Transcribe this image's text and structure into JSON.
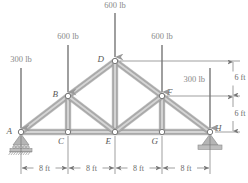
{
  "figure": {
    "colors": {
      "member": "#a9a9a9",
      "member_highlight": "#d8d8d8",
      "member_edge": "#8e8e8e",
      "load_arrow": "#9a9a9a",
      "dimension_line": "#777777",
      "node_fill": "#ffffff",
      "node_stroke": "#777777",
      "support_fill": "#b5b5b5",
      "text": "#6a6a6a",
      "background": "#ffffff"
    }
  },
  "nodes": [
    {
      "id": "A",
      "label": "A",
      "x": 21,
      "y": 132,
      "label_dx": -9,
      "label_dy": 2
    },
    {
      "id": "B",
      "label": "B",
      "x": 68,
      "y": 96,
      "label_dx": -10,
      "label_dy": 1
    },
    {
      "id": "C",
      "label": "C",
      "x": 68,
      "y": 132,
      "label_dx": -4,
      "label_dy": 12
    },
    {
      "id": "D",
      "label": "D",
      "x": 115,
      "y": 61,
      "label_dx": -11,
      "label_dy": 1
    },
    {
      "id": "E",
      "label": "E",
      "x": 115,
      "y": 132,
      "label_dx": -4,
      "label_dy": 12
    },
    {
      "id": "F",
      "label": "F",
      "x": 162,
      "y": 96,
      "label_dx": 5,
      "label_dy": -1
    },
    {
      "id": "G",
      "label": "G",
      "x": 162,
      "y": 132,
      "label_dx": -4,
      "label_dy": 12
    },
    {
      "id": "H",
      "label": "H",
      "x": 210,
      "y": 132,
      "label_dx": 5,
      "label_dy": -1
    }
  ],
  "members": [
    {
      "name": "A-C",
      "from": "A",
      "to": "C"
    },
    {
      "name": "C-E",
      "from": "C",
      "to": "E"
    },
    {
      "name": "E-G",
      "from": "E",
      "to": "G"
    },
    {
      "name": "G-H",
      "from": "G",
      "to": "H"
    },
    {
      "name": "A-B",
      "from": "A",
      "to": "B"
    },
    {
      "name": "B-D",
      "from": "B",
      "to": "D"
    },
    {
      "name": "D-F",
      "from": "D",
      "to": "F"
    },
    {
      "name": "F-H",
      "from": "F",
      "to": "H"
    },
    {
      "name": "B-C",
      "from": "B",
      "to": "C"
    },
    {
      "name": "D-E",
      "from": "D",
      "to": "E"
    },
    {
      "name": "F-G",
      "from": "F",
      "to": "G"
    },
    {
      "name": "B-E",
      "from": "B",
      "to": "E"
    },
    {
      "name": "E-F",
      "from": "E",
      "to": "F"
    }
  ],
  "loads": [
    {
      "name": "load-at-A",
      "label": "300 lb",
      "node": "A",
      "x": 21,
      "tip_y": 128,
      "top_y": 68,
      "label_x": 21,
      "label_y": 62,
      "anchor": "middle"
    },
    {
      "name": "load-at-B",
      "label": "600 lb",
      "node": "B",
      "x": 68,
      "tip_y": 92,
      "top_y": 45,
      "label_x": 68,
      "label_y": 39,
      "anchor": "middle"
    },
    {
      "name": "load-at-D",
      "label": "600 lb",
      "node": "D",
      "x": 115,
      "tip_y": 57,
      "top_y": 13,
      "label_x": 115,
      "label_y": 8,
      "anchor": "middle"
    },
    {
      "name": "load-at-F",
      "label": "600 lb",
      "node": "F",
      "x": 162,
      "tip_y": 92,
      "top_y": 45,
      "label_x": 162,
      "label_y": 39,
      "anchor": "middle"
    },
    {
      "name": "load-at-H",
      "label": "300 lb",
      "node": "H",
      "x": 210,
      "tip_y": 128,
      "top_y": 68,
      "label_x": 205,
      "label_y": 82,
      "anchor": "end"
    }
  ],
  "supports": [
    {
      "name": "support-left-roller",
      "node": "A",
      "type": "roller",
      "x": 21,
      "y": 132
    },
    {
      "name": "support-right-pin",
      "node": "H",
      "type": "pin",
      "x": 210,
      "y": 132
    }
  ],
  "dimensions": {
    "horizontal": {
      "baseline_y": 168,
      "spans": [
        {
          "label": "8 ft",
          "x1": 21,
          "x2": 68
        },
        {
          "label": "8 ft",
          "x1": 68,
          "x2": 115
        },
        {
          "label": "8 ft",
          "x1": 115,
          "x2": 162
        },
        {
          "label": "8 ft",
          "x1": 162,
          "x2": 210
        }
      ],
      "extension_lines": [
        {
          "x": 21,
          "y1": 136,
          "y2": 174
        },
        {
          "x": 68,
          "y1": 136,
          "y2": 174
        },
        {
          "x": 115,
          "y1": 136,
          "y2": 174
        },
        {
          "x": 162,
          "y1": 136,
          "y2": 174
        },
        {
          "x": 210,
          "y1": 136,
          "y2": 174
        }
      ]
    },
    "vertical": {
      "axis_x": 233,
      "segments": [
        {
          "label": "6 ft",
          "y1": 61,
          "y2": 96,
          "label_x": 240,
          "label_y": 80
        },
        {
          "label": "6 ft",
          "y1": 96,
          "y2": 132,
          "label_x": 240,
          "label_y": 116
        }
      ],
      "extension_lines": [
        {
          "y": 61,
          "x1": 120,
          "x2": 240
        },
        {
          "y": 96,
          "x1": 167,
          "x2": 240
        },
        {
          "y": 132,
          "x1": 215,
          "x2": 240
        }
      ]
    }
  }
}
